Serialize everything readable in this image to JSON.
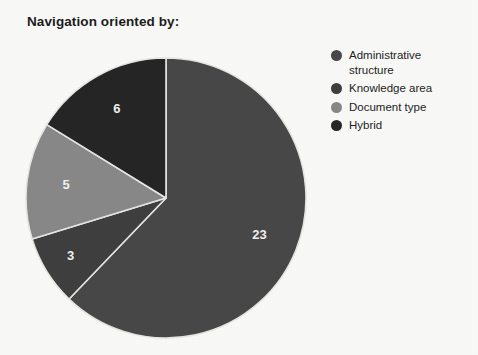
{
  "chart_data": {
    "type": "pie",
    "title": "Navigation oriented by:",
    "categories": [
      "Administrative structure",
      "Knowledge area",
      "Document type",
      "Hybrid"
    ],
    "values": [
      23,
      3,
      5,
      6
    ],
    "total": 37,
    "data_labels": [
      "23",
      "3",
      "5",
      "6"
    ],
    "colors": [
      "#4a4a4a",
      "#3f3f3f",
      "#8a8a8a",
      "#272727"
    ],
    "legend_position": "right",
    "start_angle_deg": 0,
    "direction": "clockwise",
    "grid": false,
    "xlabel": "",
    "ylabel": ""
  },
  "title": "Navigation oriented by:",
  "legend": {
    "items": [
      {
        "label": "Administrative structure",
        "color": "#4a4a4a",
        "value": "23"
      },
      {
        "label": "Knowledge area",
        "color": "#3f3f3f",
        "value": "3"
      },
      {
        "label": "Document type",
        "color": "#8a8a8a",
        "value": "5"
      },
      {
        "label": "Hybrid",
        "color": "#272727",
        "value": "6"
      }
    ]
  },
  "slice_labels": {
    "administrative_structure": "23",
    "knowledge_area": "3",
    "document_type": "5",
    "hybrid": "6"
  }
}
